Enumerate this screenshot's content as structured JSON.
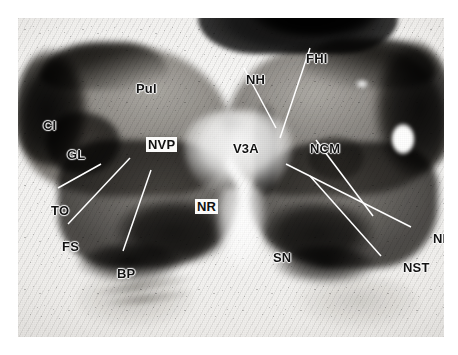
{
  "figure": {
    "kind": "histological-brain-section",
    "plane": "coronal",
    "stain_appearance": "grayscale myelin-stained section",
    "frame": {
      "background_color": "#ffffff",
      "plate_color": "#f2f1ef"
    }
  },
  "labels": [
    {
      "id": "pul",
      "text": "Pul",
      "x": 118,
      "y": 64,
      "boxed": false,
      "leader": false
    },
    {
      "id": "ci",
      "text": "CI",
      "x": 25,
      "y": 101,
      "boxed": false,
      "leader": false
    },
    {
      "id": "gl",
      "text": "GL",
      "x": 49,
      "y": 130,
      "boxed": false,
      "leader": false
    },
    {
      "id": "nvp",
      "text": "NVP",
      "x": 128,
      "y": 119,
      "boxed": true,
      "leader": false
    },
    {
      "id": "nr",
      "text": "NR",
      "x": 177,
      "y": 181,
      "boxed": true,
      "leader": false
    },
    {
      "id": "v3a",
      "text": "V3A",
      "x": 215,
      "y": 124,
      "boxed": false,
      "leader": false
    },
    {
      "id": "nh",
      "text": "NH",
      "x": 228,
      "y": 55,
      "boxed": false,
      "leader": true
    },
    {
      "id": "fhi",
      "text": "FHI",
      "x": 288,
      "y": 34,
      "boxed": false,
      "leader": true
    },
    {
      "id": "ncm",
      "text": "NCM",
      "x": 292,
      "y": 124,
      "boxed": false,
      "leader": true
    },
    {
      "id": "to",
      "text": "TO",
      "x": 33,
      "y": 186,
      "boxed": false,
      "leader": true
    },
    {
      "id": "fs",
      "text": "FS",
      "x": 44,
      "y": 222,
      "boxed": false,
      "leader": true
    },
    {
      "id": "bp",
      "text": "BP",
      "x": 99,
      "y": 249,
      "boxed": false,
      "leader": true
    },
    {
      "id": "sn",
      "text": "SN",
      "x": 255,
      "y": 233,
      "boxed": false,
      "leader": false
    },
    {
      "id": "npf",
      "text": "NPF",
      "x": 415,
      "y": 214,
      "boxed": false,
      "leader": true
    },
    {
      "id": "nst",
      "text": "NST",
      "x": 385,
      "y": 243,
      "boxed": false,
      "leader": true
    }
  ],
  "leader_lines": [
    {
      "id": "leader-nh",
      "x1": 226,
      "y1": 50,
      "x2": 258,
      "y2": 110
    },
    {
      "id": "leader-fhi",
      "x1": 292,
      "y1": 30,
      "x2": 262,
      "y2": 120
    },
    {
      "id": "leader-ncm",
      "x1": 298,
      "y1": 122,
      "x2": 355,
      "y2": 198
    },
    {
      "id": "leader-to",
      "x1": 40,
      "y1": 170,
      "x2": 83,
      "y2": 146
    },
    {
      "id": "leader-fs",
      "x1": 50,
      "y1": 206,
      "x2": 112,
      "y2": 140
    },
    {
      "id": "leader-bp",
      "x1": 105,
      "y1": 233,
      "x2": 133,
      "y2": 152
    },
    {
      "id": "leader-npf",
      "x1": 393,
      "y1": 209,
      "x2": 268,
      "y2": 146
    },
    {
      "id": "leader-nst",
      "x1": 363,
      "y1": 238,
      "x2": 292,
      "y2": 158
    }
  ]
}
